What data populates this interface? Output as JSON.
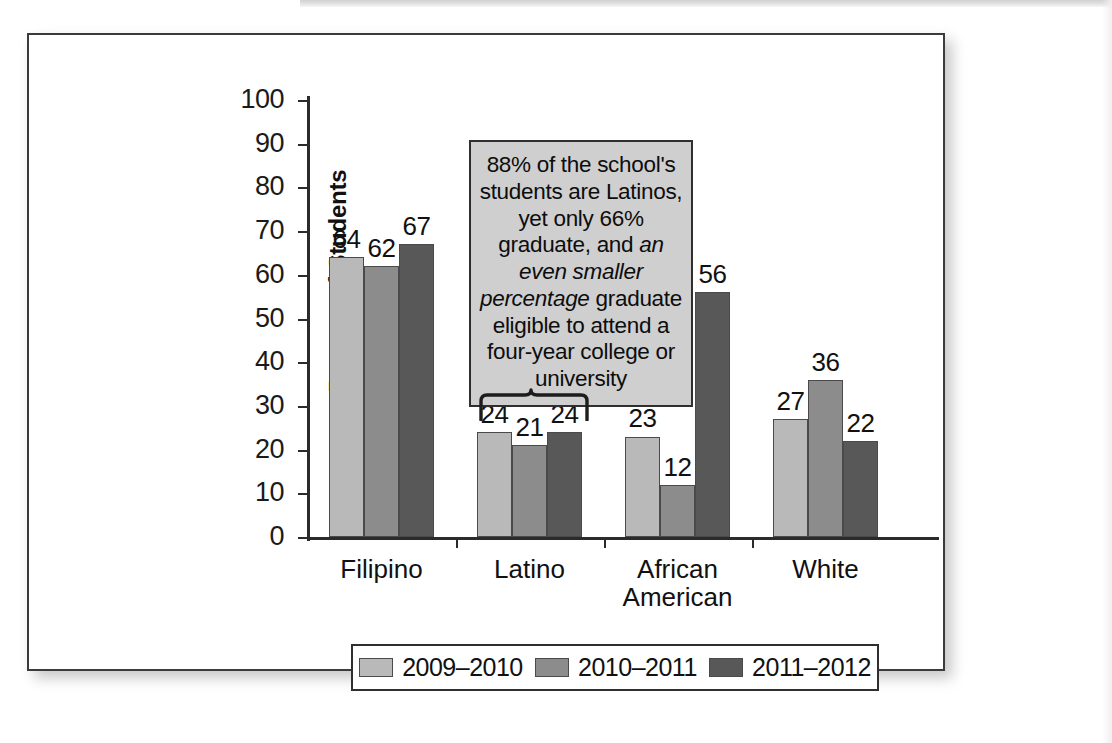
{
  "chart_data": {
    "type": "bar",
    "title": "",
    "xlabel": "",
    "ylabel": "Percent of Students",
    "ylim": [
      0,
      100
    ],
    "ytick_step": 10,
    "yticks": [
      "100",
      "90",
      "80",
      "70",
      "60",
      "50",
      "40",
      "30",
      "20",
      "10",
      "0"
    ],
    "grid": false,
    "legend_position": "bottom",
    "categories": [
      "Filipino",
      "Latino",
      "African\nAmerican",
      "White"
    ],
    "series": [
      {
        "name": "2009–2010",
        "color": "#b9b9b9",
        "values": [
          64,
          24,
          23,
          27
        ]
      },
      {
        "name": "2010–2011",
        "color": "#8c8c8c",
        "values": [
          62,
          21,
          12,
          36
        ]
      },
      {
        "name": "2011–2012",
        "color": "#585858",
        "values": [
          67,
          24,
          56,
          22
        ]
      }
    ],
    "annotations": [
      {
        "name": "latino-callout",
        "text_runs": [
          {
            "text": "88% of the school's students are Latinos, yet only 66% graduate, and ",
            "style": "normal"
          },
          {
            "text": "an even smaller percentage",
            "style": "italic"
          },
          {
            "text": " graduate eligible to attend a four-year college or university",
            "style": "normal"
          }
        ],
        "plain_text": "88% of the school's students are Latinos, yet only 66% graduate, and an even smaller percentage graduate eligible to attend a four-year college or university",
        "points_to": "Latino"
      }
    ]
  },
  "legend": {
    "items": [
      {
        "label": "2009–2010",
        "color": "#b9b9b9"
      },
      {
        "label": "2010–2011",
        "color": "#8c8c8c"
      },
      {
        "label": "2011–2012",
        "color": "#585858"
      }
    ]
  }
}
